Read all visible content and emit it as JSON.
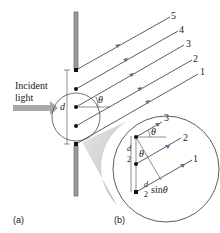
{
  "figure": {
    "incident_label_line1": "Incident",
    "incident_label_line2": "light",
    "slit_spacing_label": "d",
    "angle_label": "θ",
    "ray_labels": [
      "1",
      "2",
      "3",
      "4",
      "5"
    ],
    "panel_a_label": "(a)",
    "panel_b_label": "(b)",
    "inset": {
      "ray_labels": [
        "1",
        "2",
        "3"
      ],
      "angle_label_top": "θ",
      "angle_label_inner": "θ",
      "half_spacing_num": "d",
      "half_spacing_den": "2",
      "path_diff_num": "d",
      "path_diff_den": "2",
      "path_diff_suffix": "sin",
      "path_diff_angle": "θ"
    },
    "colors": {
      "ray": "#333333",
      "arrow_head": "#5a6a9a",
      "barrier_fill": "#9a9a9a",
      "incident_arrow": "#a8a8a8",
      "magnifier_shade": "#c8c8c8"
    }
  }
}
